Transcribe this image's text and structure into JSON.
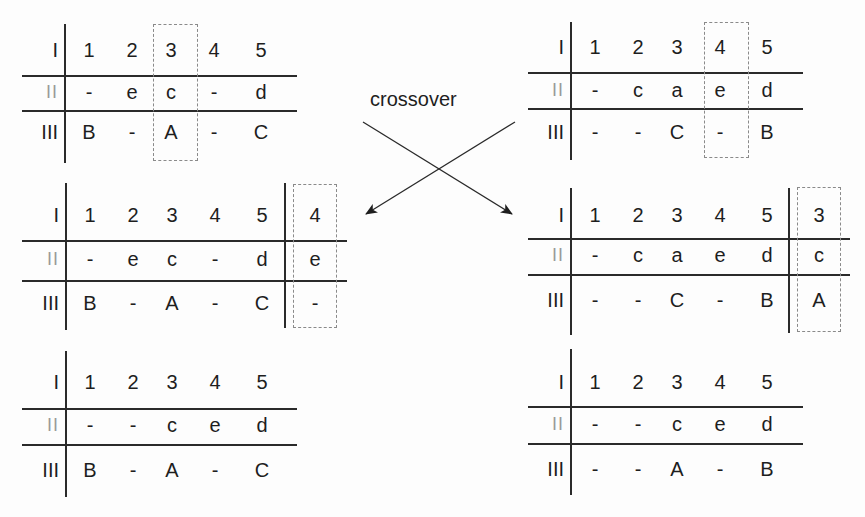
{
  "diagram": {
    "label": "crossover",
    "row_labels": [
      "I",
      "II",
      "III"
    ],
    "tables": [
      {
        "id": "parent-1",
        "position": "top-left",
        "columns": [
          "1",
          "2",
          "3",
          "4",
          "5"
        ],
        "row2": [
          "-",
          "e",
          "c",
          "-",
          "d"
        ],
        "row3": [
          "B",
          "-",
          "A",
          "-",
          "C"
        ],
        "highlighted_column": "3"
      },
      {
        "id": "parent-2",
        "position": "top-right",
        "columns": [
          "1",
          "2",
          "3",
          "4",
          "5"
        ],
        "row2": [
          "-",
          "c",
          "a",
          "e",
          "d"
        ],
        "row3": [
          "-",
          "-",
          "C",
          "-",
          "B"
        ],
        "highlighted_column": "4"
      },
      {
        "id": "offspring-1-intermediate",
        "position": "middle-left",
        "columns": [
          "1",
          "2",
          "3",
          "4",
          "5"
        ],
        "row2": [
          "-",
          "e",
          "c",
          "-",
          "d"
        ],
        "row3": [
          "B",
          "-",
          "A",
          "-",
          "C"
        ],
        "appended": {
          "col": "4",
          "row2": "e",
          "row3": "-"
        }
      },
      {
        "id": "offspring-2-intermediate",
        "position": "middle-right",
        "columns": [
          "1",
          "2",
          "3",
          "4",
          "5"
        ],
        "row2": [
          "-",
          "c",
          "a",
          "e",
          "d"
        ],
        "row3": [
          "-",
          "-",
          "C",
          "-",
          "B"
        ],
        "appended": {
          "col": "3",
          "row2": "c",
          "row3": "A"
        }
      },
      {
        "id": "offspring-1-final",
        "position": "bottom-left",
        "columns": [
          "1",
          "2",
          "3",
          "4",
          "5"
        ],
        "row2": [
          "-",
          "-",
          "c",
          "e",
          "d"
        ],
        "row3": [
          "B",
          "-",
          "A",
          "-",
          "C"
        ]
      },
      {
        "id": "offspring-2-final",
        "position": "bottom-right",
        "columns": [
          "1",
          "2",
          "3",
          "4",
          "5"
        ],
        "row2": [
          "-",
          "-",
          "c",
          "e",
          "d"
        ],
        "row3": [
          "-",
          "-",
          "A",
          "-",
          "B"
        ]
      }
    ],
    "arrows": [
      {
        "from": "parent-1",
        "to": "offspring-2-intermediate",
        "direction": "down-right"
      },
      {
        "from": "parent-2",
        "to": "offspring-1-intermediate",
        "direction": "down-left"
      }
    ]
  }
}
